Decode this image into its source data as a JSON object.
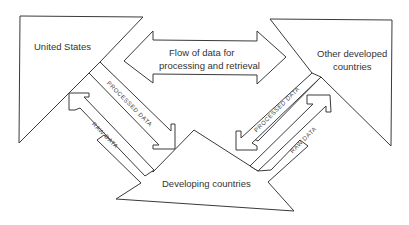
{
  "nodes": {
    "united_states": "United States",
    "other_developed_line1": "Other developed",
    "other_developed_line2": "countries",
    "developing": "Developing countries",
    "center_line1": "Flow of data for",
    "center_line2": "processing and retrieval"
  },
  "arrows": {
    "left_processed": "PROCESSED DATA",
    "left_raw": "RAW DATA",
    "right_processed": "PROCESSED DATA",
    "right_raw": "RAW DATA"
  },
  "colors": {
    "stroke": "#3a3a3a",
    "background": "#ffffff",
    "text": "#333333"
  }
}
